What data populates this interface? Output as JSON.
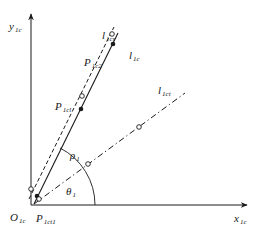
{
  "colors": {
    "stroke": "#1a1a1a",
    "background": "#ffffff"
  },
  "axes": {
    "origin": {
      "main": "O",
      "sub": "1c"
    },
    "x_axis": {
      "main": "x",
      "sub": "1c"
    },
    "y_axis": {
      "main": "y",
      "sub": "1c"
    }
  },
  "lines": [
    {
      "id": "l1c",
      "style": "solid",
      "label": {
        "main": "l",
        "sub": "1c"
      }
    },
    {
      "id": "l1cr",
      "style": "dashed",
      "label": {
        "main": "l",
        "sub": "1cr"
      }
    },
    {
      "id": "l1ct",
      "style": "dash-dot",
      "label": {
        "main": "l",
        "sub": "1ct"
      }
    }
  ],
  "points": [
    {
      "main": "P",
      "sub": "1c2"
    },
    {
      "main": "P",
      "sub": "1cl"
    },
    {
      "main": "P",
      "sub": "1ct1"
    }
  ],
  "annotations": {
    "rho": {
      "main": "ρ",
      "sub": "1"
    },
    "theta": {
      "main": "θ",
      "sub": "1"
    }
  }
}
